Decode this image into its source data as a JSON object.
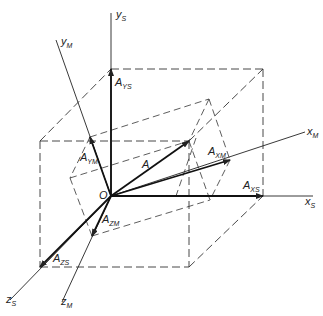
{
  "diagram": {
    "origin_label": "O",
    "vector_label": "A",
    "axes": {
      "ys": {
        "main": "y",
        "sub": "S"
      },
      "xs": {
        "main": "x",
        "sub": "S"
      },
      "zs": {
        "main": "z",
        "sub": "S"
      },
      "ym": {
        "main": "y",
        "sub": "M"
      },
      "xm": {
        "main": "x",
        "sub": "M"
      },
      "zm": {
        "main": "z",
        "sub": "M"
      }
    },
    "components": {
      "ays": {
        "main": "A",
        "sub": "YS"
      },
      "axs": {
        "main": "A",
        "sub": "XS"
      },
      "azs": {
        "main": "A",
        "sub": "ZS"
      },
      "aym": {
        "main": "A",
        "sub": "YM"
      },
      "axm": {
        "main": "A",
        "sub": "XM"
      },
      "azm": {
        "main": "A",
        "sub": "ZM"
      }
    },
    "colors": {
      "line": "#222222",
      "background": "#ffffff"
    }
  }
}
